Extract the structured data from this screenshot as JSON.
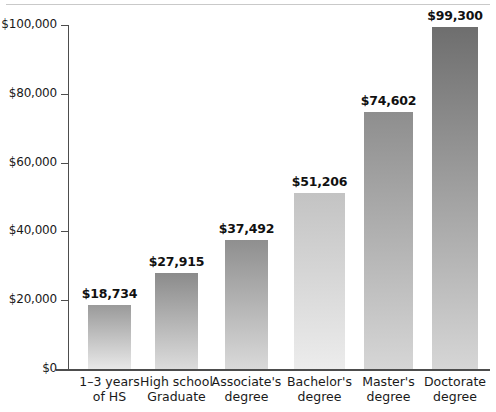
{
  "chart_data": {
    "type": "bar",
    "title": "",
    "subtitle": "",
    "xlabel": "",
    "ylabel": "",
    "ylim": [
      0,
      100000
    ],
    "grid": false,
    "legend": false,
    "axis_tick_labels": [
      "$100,000",
      "$80,000",
      "$60,000",
      "$40,000",
      "$20,000",
      "$0"
    ],
    "axis_tick_values": [
      100000,
      80000,
      60000,
      40000,
      20000,
      0
    ],
    "categories": [
      "1–3 years of HS",
      "High school Graduate",
      "Associate's degree",
      "Bachelor's degree",
      "Master's degree",
      "Doctorate degree"
    ],
    "category_lines": [
      [
        "1–3 years",
        "of HS"
      ],
      [
        "High school",
        "Graduate"
      ],
      [
        "Associate's",
        "degree"
      ],
      [
        "Bachelor's",
        "degree"
      ],
      [
        "Master's",
        "degree"
      ],
      [
        "Doctorate",
        "degree"
      ]
    ],
    "values": [
      18734,
      27915,
      37492,
      51206,
      74602,
      99300
    ],
    "value_labels": [
      "$18,734",
      "$27,915",
      "$37,492",
      "$51,206",
      "$74,602",
      "$99,300"
    ],
    "bar_colors_top": [
      "#9a9a9a",
      "#8b8b8b",
      "#8f8f8f",
      "#c3c3c3",
      "#8e8e8e",
      "#6e6e6e"
    ],
    "bar_colors_bottom": [
      "#e8e8e8",
      "#dcdcdc",
      "#d9d9d9",
      "#ececec",
      "#d6d6d6",
      "#d6d6d6"
    ]
  },
  "axis": {
    "line_color": "#4d4d4d"
  }
}
